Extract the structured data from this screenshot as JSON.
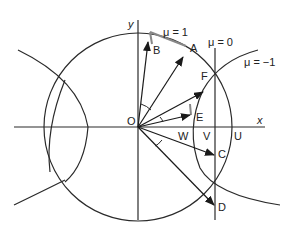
{
  "diagram": {
    "type": "geometric-vector-diagram",
    "axes": {
      "x_label": "x",
      "y_label": "y",
      "origin_label": "O"
    },
    "curve_labels": {
      "mu_pos": "μ  = 1",
      "mu_zero": "μ = 0",
      "mu_neg": "μ = −1"
    },
    "points": {
      "A": "A",
      "B": "B",
      "C": "C",
      "D": "D",
      "E": "E",
      "F": "F",
      "U": "U",
      "V": "V",
      "W": "W"
    },
    "colors": {
      "line": "#2a2a2a",
      "accent_line": "#888888",
      "background": "#ffffff"
    }
  }
}
